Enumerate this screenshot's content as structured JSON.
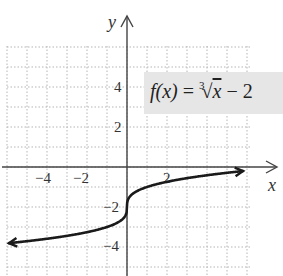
{
  "chart_data": {
    "type": "line",
    "function": "cbrt(x) - 2",
    "xlabel": "x",
    "ylabel": "y",
    "x_ticks": [
      -4,
      -2,
      2
    ],
    "y_ticks": [
      4,
      2,
      -2,
      -4
    ],
    "x_tick_labels": [
      "−4",
      "−2",
      "2"
    ],
    "y_tick_labels": [
      "4",
      "2",
      "−2",
      "−4"
    ],
    "xlim": [
      -6,
      6
    ],
    "ylim": [
      -5,
      6
    ],
    "grid": true,
    "x": [
      -6,
      -4,
      -2,
      -1,
      -0.5,
      0,
      0.5,
      1,
      2,
      4,
      6
    ],
    "y": [
      -3.82,
      -3.59,
      -3.26,
      -3.0,
      -2.79,
      -2.0,
      -1.21,
      -1.0,
      -0.74,
      -0.41,
      -0.18
    ],
    "colors": {
      "curve": "#1a1a1a",
      "grid": "#b0b0b0",
      "label_bg": "#e6e6e6"
    }
  },
  "equation": {
    "lhs": "f(x)",
    "equals": "=",
    "index": "3",
    "radicand": "x",
    "rest": "− 2"
  },
  "axes": {
    "x_label": "x",
    "y_label": "y"
  }
}
